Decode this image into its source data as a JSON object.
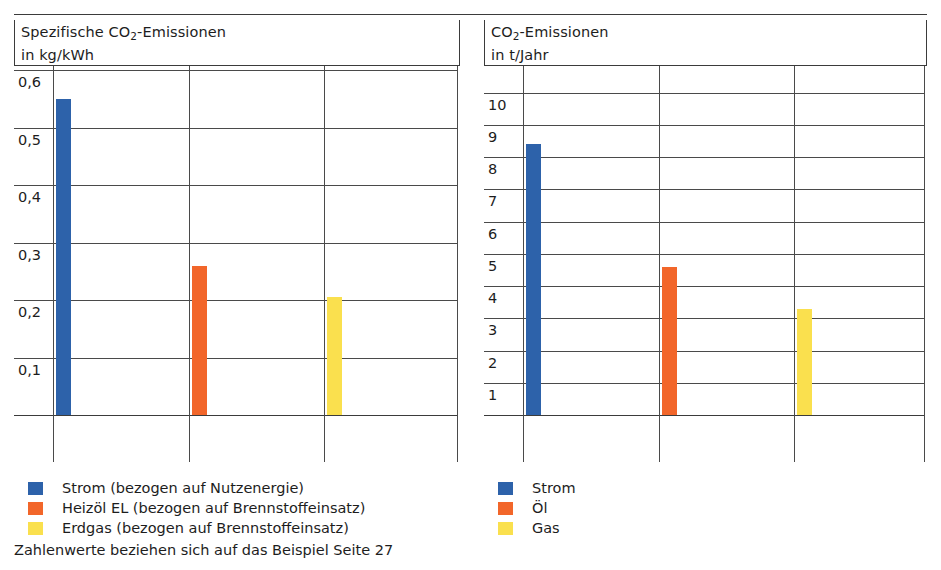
{
  "figure": {
    "footnote": "Zahlenwerte beziehen sich auf das Beispiel Seite 27"
  },
  "chart_data": [
    {
      "type": "bar",
      "id": "spezifische-co2-emissionen",
      "title": "Spezifische CO2-Emissionen",
      "title_line1_pre": "Spezifische CO",
      "title_line1_sub": "2",
      "title_line1_post": "-Emissionen",
      "title_line2": "in kg/kWh",
      "ylabel": "in kg/kWh",
      "xlabel": "",
      "ylim": [
        0,
        0.6
      ],
      "ytick_values": [
        0.1,
        0.2,
        0.3,
        0.4,
        0.5,
        0.6
      ],
      "ytick_labels": [
        "0,1",
        "0,2",
        "0,3",
        "0,4",
        "0,5",
        "0,6"
      ],
      "grid": true,
      "categories": [
        "Strom",
        "Heizöl EL",
        "Erdgas"
      ],
      "values": [
        0.55,
        0.26,
        0.205
      ],
      "colors": [
        "#2d62aa",
        "#f2662a",
        "#fae04e"
      ],
      "legend_position": "below",
      "legend": [
        {
          "label": "Strom (bezogen auf Nutzenergie)",
          "color": "#2d62aa"
        },
        {
          "label": "Heizöl EL (bezogen auf Brennstoffeinsatz)",
          "color": "#f2662a"
        },
        {
          "label": "Erdgas (bezogen auf Brennstoffeinsatz)",
          "color": "#fae04e"
        }
      ]
    },
    {
      "type": "bar",
      "id": "co2-emissionen-jahr",
      "title": "CO2-Emissionen",
      "title_line1_pre": "CO",
      "title_line1_sub": "2",
      "title_line1_post": "-Emissionen",
      "title_line2": "in t/Jahr",
      "ylabel": "in t/Jahr",
      "xlabel": "",
      "ylim": [
        0,
        10.7
      ],
      "ytick_values": [
        1,
        2,
        3,
        4,
        5,
        6,
        7,
        8,
        9,
        10
      ],
      "ytick_labels": [
        "1",
        "2",
        "3",
        "4",
        "5",
        "6",
        "7",
        "8",
        "9",
        "10"
      ],
      "grid": true,
      "categories": [
        "Strom",
        "Öl",
        "Gas"
      ],
      "values": [
        8.4,
        4.6,
        3.3
      ],
      "colors": [
        "#2d62aa",
        "#f2662a",
        "#fae04e"
      ],
      "legend_position": "below",
      "legend": [
        {
          "label": "Strom",
          "color": "#2d62aa"
        },
        {
          "label": "Öl",
          "color": "#f2662a"
        },
        {
          "label": "Gas",
          "color": "#fae04e"
        }
      ]
    }
  ]
}
